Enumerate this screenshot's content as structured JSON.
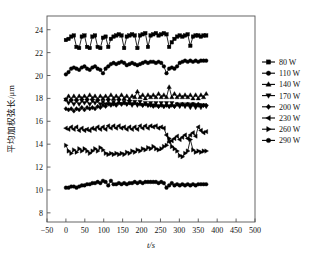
{
  "figure": {
    "background": "#ffffff",
    "line_color": "#000000",
    "frame_color": "#555555"
  },
  "chart_data": {
    "type": "line",
    "title": "",
    "xlabel": "t/s",
    "ylabel": "平均加权弦长/μm",
    "xlim": [
      -50,
      500
    ],
    "ylim": [
      7.2,
      25.2
    ],
    "xticks": [
      -50,
      0,
      50,
      100,
      150,
      200,
      250,
      300,
      350,
      400,
      450,
      500
    ],
    "yticks": [
      8,
      10,
      12,
      14,
      16,
      18,
      20,
      22,
      24
    ],
    "grid": false,
    "legend_position": "right",
    "x": [
      0,
      7,
      14,
      21,
      28,
      35,
      42,
      49,
      56,
      63,
      70,
      77,
      84,
      91,
      98,
      105,
      112,
      119,
      126,
      133,
      140,
      147,
      154,
      161,
      168,
      175,
      182,
      189,
      196,
      203,
      210,
      217,
      224,
      231,
      238,
      245,
      252,
      259,
      266,
      273,
      280,
      287,
      294,
      301,
      308,
      315,
      322,
      329,
      336,
      343,
      350,
      357,
      364,
      371
    ],
    "series": [
      {
        "name": "80 W",
        "marker": "square",
        "values": [
          23.1,
          23.2,
          23.4,
          23.5,
          22.5,
          22.4,
          23.4,
          23.5,
          22.5,
          22.4,
          23.4,
          23.5,
          22.5,
          22.4,
          23.3,
          23.4,
          22.5,
          23.2,
          23.4,
          23.5,
          23.6,
          23.5,
          22.4,
          23.4,
          23.5,
          23.6,
          23.5,
          22.4,
          23.5,
          23.6,
          23.7,
          22.5,
          23.5,
          23.6,
          23.7,
          23.5,
          23.6,
          23.7,
          23.6,
          22.5,
          22.9,
          23.2,
          23.4,
          23.5,
          23.4,
          23.5,
          23.6,
          22.6,
          23.4,
          23.5,
          23.5,
          23.4,
          23.5,
          23.5
        ]
      },
      {
        "name": "110 W",
        "marker": "circle",
        "values": [
          20.1,
          20.3,
          20.6,
          20.7,
          20.6,
          20.5,
          20.7,
          20.8,
          20.6,
          20.5,
          20.7,
          20.8,
          20.6,
          20.5,
          20.2,
          20.6,
          20.8,
          21.0,
          21.1,
          21.0,
          21.1,
          21.2,
          21.1,
          20.9,
          21.0,
          21.1,
          21.0,
          20.9,
          21.0,
          21.1,
          21.2,
          21.1,
          21.2,
          21.2,
          21.1,
          21.2,
          21.1,
          20.8,
          20.2,
          20.6,
          20.7,
          20.6,
          20.8,
          21.1,
          21.2,
          21.3,
          21.2,
          21.3,
          21.2,
          21.3,
          21.2,
          21.3,
          21.3,
          21.3
        ]
      },
      {
        "name": "140 W",
        "marker": "triangle-up",
        "values": [
          17.9,
          18.2,
          17.9,
          18.2,
          17.9,
          18.2,
          18.0,
          18.2,
          18.0,
          18.3,
          18.0,
          18.2,
          17.9,
          18.2,
          18.0,
          18.2,
          18.0,
          18.3,
          18.0,
          18.2,
          18.0,
          18.3,
          18.0,
          18.2,
          17.9,
          18.2,
          18.1,
          18.6,
          18.1,
          18.3,
          18.0,
          18.3,
          18.1,
          18.3,
          18.1,
          18.4,
          18.1,
          18.3,
          18.1,
          19.0,
          18.1,
          18.4,
          18.1,
          18.3,
          18.1,
          18.3,
          18.1,
          18.3,
          18.0,
          18.3,
          18.0,
          18.3,
          18.1,
          18.4
        ]
      },
      {
        "name": "170 W",
        "marker": "triangle-down",
        "values": [
          17.9,
          17.6,
          17.8,
          17.5,
          17.8,
          17.5,
          17.8,
          17.6,
          17.8,
          17.5,
          17.8,
          17.6,
          17.8,
          17.5,
          17.7,
          17.5,
          17.8,
          17.5,
          17.7,
          17.5,
          17.8,
          17.5,
          17.7,
          17.5,
          17.7,
          17.4,
          17.7,
          17.4,
          17.7,
          17.4,
          17.6,
          17.4,
          17.6,
          17.4,
          17.6,
          17.3,
          17.6,
          17.3,
          17.6,
          17.3,
          17.6,
          17.3,
          17.5,
          17.3,
          17.5,
          17.3,
          17.5,
          17.2,
          17.5,
          17.2,
          17.4,
          17.2,
          17.4,
          17.3
        ]
      },
      {
        "name": "200 W",
        "marker": "diamond",
        "values": [
          17.1,
          17.0,
          17.1,
          16.9,
          17.1,
          17.0,
          17.2,
          17.0,
          17.2,
          17.1,
          17.2,
          17.1,
          17.3,
          17.2,
          17.4,
          17.3,
          17.5,
          17.4,
          17.5,
          17.4,
          17.6,
          17.5,
          17.6,
          17.5,
          17.6,
          17.5,
          17.6,
          17.5,
          17.5,
          17.4,
          17.5,
          17.4,
          17.4,
          17.3,
          17.4,
          17.3,
          17.4,
          17.3,
          17.4,
          17.3,
          17.4,
          17.3,
          17.5,
          17.4,
          17.5,
          17.4,
          17.5,
          17.4,
          17.5,
          17.4,
          17.5,
          17.4,
          17.4,
          17.4
        ]
      },
      {
        "name": "230 W",
        "marker": "triangle-left",
        "values": [
          15.4,
          15.3,
          15.5,
          15.3,
          15.5,
          15.2,
          15.4,
          15.2,
          15.3,
          15.2,
          15.4,
          15.3,
          15.5,
          15.3,
          15.5,
          15.3,
          15.6,
          15.4,
          15.6,
          15.4,
          15.6,
          15.4,
          15.5,
          15.3,
          15.5,
          15.3,
          15.5,
          15.3,
          15.6,
          15.4,
          15.6,
          15.4,
          15.6,
          15.5,
          15.6,
          15.4,
          15.5,
          15.4,
          14.8,
          14.2,
          14.3,
          14.5,
          14.7,
          14.4,
          14.6,
          14.8,
          14.5,
          14.8,
          15.0,
          14.7,
          15.5,
          15.2,
          15.0,
          15.1
        ]
      },
      {
        "name": "260 W",
        "marker": "triangle-right",
        "values": [
          13.9,
          13.4,
          13.2,
          13.5,
          13.3,
          13.6,
          13.4,
          13.6,
          13.4,
          13.2,
          13.4,
          13.6,
          13.4,
          13.7,
          13.5,
          13.2,
          13.1,
          13.2,
          13.1,
          13.2,
          13.1,
          13.2,
          13.1,
          13.3,
          13.2,
          13.4,
          13.3,
          13.5,
          13.4,
          13.6,
          13.5,
          13.7,
          13.6,
          13.8,
          13.6,
          13.5,
          13.6,
          13.8,
          13.9,
          14.5,
          13.8,
          13.6,
          13.4,
          13.0,
          12.9,
          13.2,
          13.4,
          14.4,
          13.5,
          13.3,
          13.4,
          13.3,
          13.4,
          13.4
        ]
      },
      {
        "name": "290 W",
        "marker": "circle",
        "values": [
          10.2,
          10.2,
          10.3,
          10.3,
          10.2,
          10.3,
          10.4,
          10.4,
          10.5,
          10.5,
          10.6,
          10.6,
          10.7,
          10.6,
          10.8,
          10.7,
          10.4,
          10.8,
          10.5,
          10.5,
          10.6,
          10.5,
          10.6,
          10.5,
          10.6,
          10.6,
          10.7,
          10.6,
          10.7,
          10.6,
          10.7,
          10.7,
          10.7,
          10.7,
          10.7,
          10.6,
          10.7,
          10.6,
          10.2,
          10.4,
          10.6,
          10.4,
          10.5,
          10.4,
          10.5,
          10.4,
          10.5,
          10.4,
          10.5,
          10.4,
          10.5,
          10.5,
          10.5,
          10.5
        ]
      }
    ]
  }
}
